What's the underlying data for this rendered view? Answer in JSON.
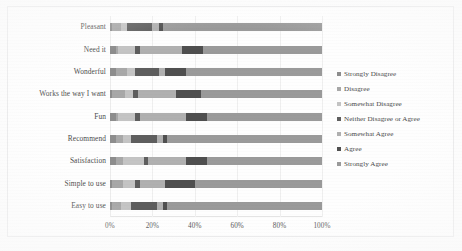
{
  "chart_data": {
    "type": "bar",
    "orientation": "horizontal",
    "stacked": true,
    "normalized_percent": true,
    "title": "",
    "subtitle": "",
    "xlabel": "",
    "ylabel": "",
    "xlim": [
      0,
      100
    ],
    "xticks": [
      0,
      20,
      40,
      60,
      80,
      100
    ],
    "xtick_labels": [
      "0%",
      "20%",
      "40%",
      "60%",
      "80%",
      "100%"
    ],
    "grid": true,
    "grid_axis": "x",
    "legend_position": "right",
    "categories": [
      "Pleasant",
      "Need it",
      "Wonderful",
      "Works the way I want",
      "Fun",
      "Recommend",
      "Satisfaction",
      "Simple to use",
      "Easy to use"
    ],
    "series": [
      {
        "name": "Strongly Disagree",
        "color": "#8d8d8d",
        "values": [
          1,
          3,
          3,
          1,
          3,
          3,
          3,
          1,
          1
        ]
      },
      {
        "name": "Disagree",
        "color": "#a8a8a8",
        "values": [
          4,
          1,
          5,
          6,
          1,
          3,
          3,
          5,
          4
        ]
      },
      {
        "name": "Somewhat Disagree",
        "color": "#c4c4c4",
        "values": [
          3,
          8,
          4,
          4,
          8,
          4,
          10,
          6,
          5
        ]
      },
      {
        "name": "Neither Disagree or Agree",
        "color": "#5e5e5e",
        "values": [
          12,
          2,
          11,
          2,
          2,
          12,
          2,
          2,
          12
        ]
      },
      {
        "name": "Somewhat Agree",
        "color": "#b0b0b0",
        "values": [
          3,
          20,
          3,
          18,
          22,
          3,
          18,
          12,
          3
        ]
      },
      {
        "name": "Agree",
        "color": "#4f4f4f",
        "values": [
          2,
          10,
          10,
          12,
          10,
          2,
          10,
          14,
          2
        ]
      },
      {
        "name": "Strongly Agree",
        "color": "#9a9a9a",
        "values": [
          75,
          56,
          64,
          57,
          54,
          73,
          54,
          60,
          73
        ]
      }
    ]
  },
  "legend": {
    "items": [
      "Strongly Disagree",
      "Disagree",
      "Somewhat Disagree",
      "Neither Disagree or Agree",
      "Somewhat Agree",
      "Agree",
      "Strongly Agree"
    ]
  }
}
